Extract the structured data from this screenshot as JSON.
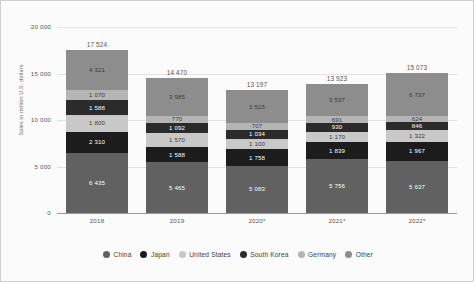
{
  "chart_data": {
    "type": "bar",
    "stacked": true,
    "title": "",
    "xlabel": "",
    "ylabel": "Sales in million U.S. dollars",
    "categories": [
      "2018",
      "2019",
      "2020*",
      "2021*",
      "2022*"
    ],
    "ylim": [
      0,
      20000
    ],
    "yticks": [
      "0",
      "5 000",
      "10 000",
      "15 000",
      "20 000"
    ],
    "ytick_values": [
      0,
      5000,
      10000,
      15000,
      20000
    ],
    "grid": true,
    "legend_position": "bottom",
    "totals": [
      "17 524",
      "14 470",
      "13 197",
      "13 923",
      "15 073"
    ],
    "total_values": [
      17524,
      14470,
      13197,
      13923,
      15073
    ],
    "series": [
      {
        "name": "China",
        "color": "#616161",
        "label_color": "#ffffff",
        "values": [
          6435,
          5465,
          5083,
          5756,
          5637
        ],
        "labels": [
          "6 435",
          "5 465",
          "5 083",
          "5 756",
          "5 637"
        ]
      },
      {
        "name": "Japan",
        "color": "#1c1c1c",
        "label_color": "#ffffff",
        "values": [
          2310,
          1588,
          1758,
          1839,
          1967
        ],
        "labels": [
          "2 310",
          "1 588",
          "1 758",
          "1 839",
          "1 967"
        ]
      },
      {
        "name": "United States",
        "color": "#c8c8c8",
        "label_color": "#3a3a3a",
        "values": [
          1800,
          1570,
          1100,
          1170,
          1322
        ],
        "labels": [
          "1 800",
          "1 570",
          "1 100",
          "1 170",
          "1 322"
        ]
      },
      {
        "name": "South Korea",
        "color": "#2b2b2b",
        "label_color": "#ffffff",
        "values": [
          1588,
          1092,
          1034,
          930,
          846
        ],
        "labels": [
          "1 588",
          "1 092",
          "1 034",
          "930",
          "846"
        ]
      },
      {
        "name": "Germany",
        "color": "#b5b5b5",
        "label_color": "#3a3a3a",
        "values": [
          1070,
          770,
          707,
          691,
          624
        ],
        "labels": [
          "1 070",
          "770",
          "707",
          "691",
          "624"
        ]
      },
      {
        "name": "Other",
        "color": "#8d8d8d",
        "label_color": "#3a3a3a",
        "values": [
          4321,
          3985,
          3515,
          3537,
          4677
        ],
        "labels": [
          "4 321",
          "3 985",
          "3 515",
          "3 537",
          "6 737"
        ]
      }
    ]
  },
  "legend": {
    "items": [
      {
        "label": "China",
        "color": "#616161"
      },
      {
        "label": "Japan",
        "color": "#1c1c1c"
      },
      {
        "label": "United States",
        "color": "#c8c8c8"
      },
      {
        "label": "South Korea",
        "color": "#2b2b2b"
      },
      {
        "label": "Germany",
        "color": "#b5b5b5"
      },
      {
        "label": "Other",
        "color": "#8d8d8d"
      }
    ]
  }
}
